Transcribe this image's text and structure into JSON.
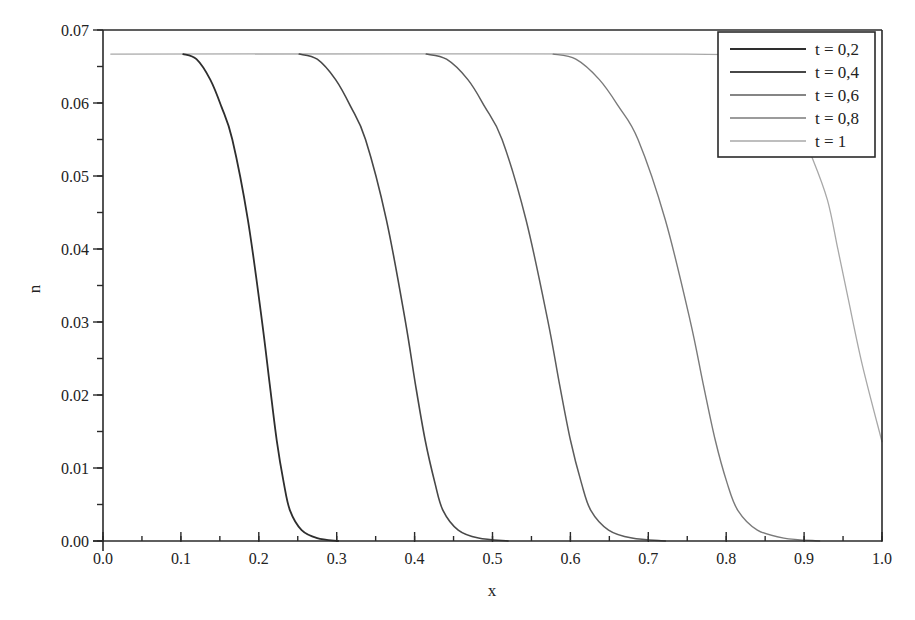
{
  "chart_data": {
    "type": "line",
    "title": "",
    "xlabel": "x",
    "ylabel": "n",
    "xlim": [
      0.0,
      1.0
    ],
    "ylim": [
      0.0,
      0.07
    ],
    "grid": false,
    "legend_position": "upper right",
    "x_ticks": [
      "0.0",
      "0.1",
      "0.2",
      "0.3",
      "0.4",
      "0.5",
      "0.6",
      "0.7",
      "0.8",
      "0.9",
      "1.0"
    ],
    "x_tick_values": [
      0.0,
      0.1,
      0.2,
      0.3,
      0.4,
      0.5,
      0.6,
      0.7,
      0.8,
      0.9,
      1.0
    ],
    "x_minor_step": 0.05,
    "y_ticks": [
      "0.00",
      "0.01",
      "0.02",
      "0.03",
      "0.04",
      "0.05",
      "0.06",
      "0.07"
    ],
    "y_tick_values": [
      0.0,
      0.01,
      0.02,
      0.03,
      0.04,
      0.05,
      0.06,
      0.07
    ],
    "y_minor_step": 0.005,
    "series": [
      {
        "name": "t = 0,2",
        "color": "#2e2e2e",
        "width": 1.8,
        "points": [
          [
            0.103,
            0.0667
          ],
          [
            0.12,
            0.066
          ],
          [
            0.1377,
            0.0632
          ],
          [
            0.152,
            0.0595
          ],
          [
            0.166,
            0.055
          ],
          [
            0.186,
            0.044
          ],
          [
            0.204,
            0.0302
          ],
          [
            0.214,
            0.0215
          ],
          [
            0.223,
            0.0138
          ],
          [
            0.232,
            0.008
          ],
          [
            0.24,
            0.0042
          ],
          [
            0.255,
            0.0015
          ],
          [
            0.275,
            0.0004
          ],
          [
            0.302,
            0.0
          ]
        ]
      },
      {
        "name": "t = 0,4",
        "color": "#474747",
        "width": 1.6,
        "points": [
          [
            0.252,
            0.0667
          ],
          [
            0.275,
            0.066
          ],
          [
            0.2986,
            0.0632
          ],
          [
            0.318,
            0.0595
          ],
          [
            0.337,
            0.055
          ],
          [
            0.3638,
            0.044
          ],
          [
            0.388,
            0.0302
          ],
          [
            0.401,
            0.0215
          ],
          [
            0.4136,
            0.0138
          ],
          [
            0.426,
            0.008
          ],
          [
            0.4364,
            0.0042
          ],
          [
            0.456,
            0.0015
          ],
          [
            0.482,
            0.0004
          ],
          [
            0.52,
            0.0
          ]
        ]
      },
      {
        "name": "t = 0,6",
        "color": "#5c5c5c",
        "width": 1.5,
        "points": [
          [
            0.415,
            0.0667
          ],
          [
            0.441,
            0.066
          ],
          [
            0.4684,
            0.0632
          ],
          [
            0.49,
            0.0595
          ],
          [
            0.5123,
            0.055
          ],
          [
            0.543,
            0.044
          ],
          [
            0.571,
            0.0302
          ],
          [
            0.586,
            0.0215
          ],
          [
            0.6001,
            0.0138
          ],
          [
            0.614,
            0.008
          ],
          [
            0.6262,
            0.0042
          ],
          [
            0.649,
            0.0015
          ],
          [
            0.679,
            0.0004
          ],
          [
            0.722,
            0.0
          ]
        ]
      },
      {
        "name": "t = 0,8",
        "color": "#7a7a7a",
        "width": 1.4,
        "points": [
          [
            0.578,
            0.0667
          ],
          [
            0.607,
            0.066
          ],
          [
            0.6372,
            0.0632
          ],
          [
            0.662,
            0.0595
          ],
          [
            0.6868,
            0.055
          ],
          [
            0.7218,
            0.044
          ],
          [
            0.7537,
            0.0302
          ],
          [
            0.7705,
            0.0215
          ],
          [
            0.786,
            0.0138
          ],
          [
            0.801,
            0.008
          ],
          [
            0.8149,
            0.0042
          ],
          [
            0.84,
            0.0015
          ],
          [
            0.874,
            0.0004
          ],
          [
            0.92,
            0.0
          ]
        ]
      },
      {
        "name": "t = 1",
        "color": "#a8a8a8",
        "width": 1.3,
        "points": [
          [
            0.01,
            0.0667
          ],
          [
            0.75,
            0.0667
          ],
          [
            0.8,
            0.0662
          ],
          [
            0.84,
            0.0645
          ],
          [
            0.87,
            0.061
          ],
          [
            0.895,
            0.056
          ],
          [
            0.91,
            0.0526
          ],
          [
            0.93,
            0.0467
          ],
          [
            0.9435,
            0.0399
          ],
          [
            0.9564,
            0.0333
          ],
          [
            0.975,
            0.024
          ],
          [
            1.0,
            0.0136
          ]
        ]
      }
    ]
  }
}
